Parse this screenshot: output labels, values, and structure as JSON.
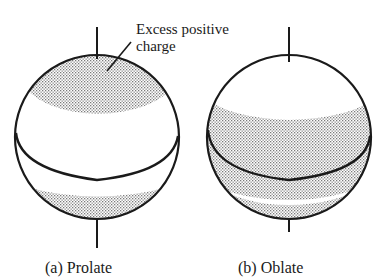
{
  "figure": {
    "annotation": {
      "line1": "Excess positive",
      "line2": "charge"
    },
    "panels": [
      {
        "id": "prolate",
        "caption": "(a) Prolate",
        "charge_regions": [
          "north-polar-cap",
          "south-polar-cap"
        ]
      },
      {
        "id": "oblate",
        "caption": "(b) Oblate",
        "charge_regions": [
          "equatorial-band"
        ]
      }
    ],
    "colors": {
      "line": "#1a1a1a",
      "shading": "#9a9a9a",
      "background": "#ffffff"
    }
  }
}
